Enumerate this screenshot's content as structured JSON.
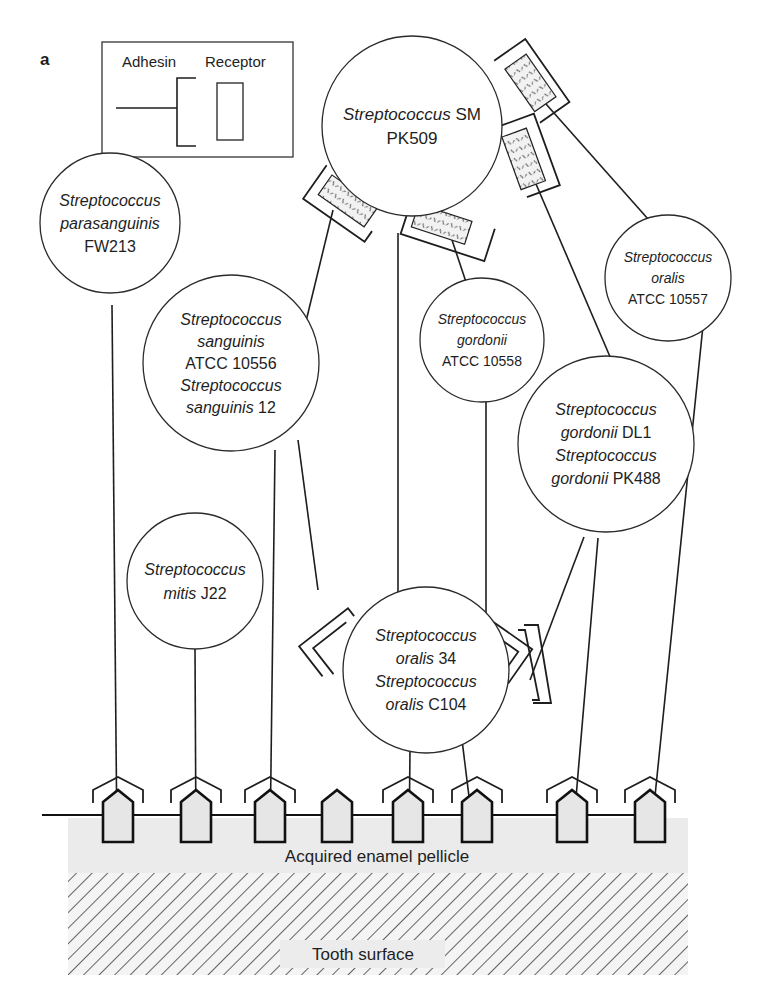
{
  "panel_label": "a",
  "legend": {
    "adhesin_label": "Adhesin",
    "receptor_label": "Receptor"
  },
  "cells": [
    {
      "id": "sm-pk509",
      "lines": [
        {
          "italic": "Streptococcus",
          "plain": " SM"
        },
        {
          "italic": "",
          "plain": "PK509"
        }
      ]
    },
    {
      "id": "parasanguinis-fw213",
      "lines": [
        {
          "italic": "Streptococcus",
          "plain": ""
        },
        {
          "italic": "parasanguinis",
          "plain": ""
        },
        {
          "italic": "",
          "plain": "FW213"
        }
      ]
    },
    {
      "id": "sanguinis",
      "lines": [
        {
          "italic": "Streptococcus",
          "plain": ""
        },
        {
          "italic": "sanguinis",
          "plain": ""
        },
        {
          "italic": "",
          "plain": "ATCC 10556"
        },
        {
          "italic": "Streptococcus",
          "plain": ""
        },
        {
          "italic": "sanguinis",
          "plain": " 12"
        }
      ]
    },
    {
      "id": "gordonii-10558",
      "lines": [
        {
          "italic": "Streptococcus",
          "plain": ""
        },
        {
          "italic": "gordonii",
          "plain": ""
        },
        {
          "italic": "",
          "plain": "ATCC 10558"
        }
      ]
    },
    {
      "id": "oralis-10557",
      "lines": [
        {
          "italic": "Streptococcus",
          "plain": ""
        },
        {
          "italic": "oralis",
          "plain": ""
        },
        {
          "italic": "",
          "plain": "ATCC 10557"
        }
      ]
    },
    {
      "id": "gordonii-dl1-pk488",
      "lines": [
        {
          "italic": "Streptococcus",
          "plain": ""
        },
        {
          "italic": "gordonii",
          "plain": " DL1"
        },
        {
          "italic": "Streptococcus",
          "plain": ""
        },
        {
          "italic": "gordonii",
          "plain": " PK488"
        }
      ]
    },
    {
      "id": "mitis-j22",
      "lines": [
        {
          "italic": "Streptococcus",
          "plain": ""
        },
        {
          "italic": "mitis",
          "plain": " J22"
        }
      ]
    },
    {
      "id": "oralis-34-c104",
      "lines": [
        {
          "italic": "Streptococcus",
          "plain": ""
        },
        {
          "italic": "oralis",
          "plain": " 34"
        },
        {
          "italic": "Streptococcus",
          "plain": ""
        },
        {
          "italic": "oralis",
          "plain": " C104"
        }
      ]
    }
  ],
  "layers": {
    "pellicle_label": "Acquired enamel pellicle",
    "tooth_label": "Tooth surface"
  },
  "colors": {
    "ink": "#1e1e1e",
    "pellicle": "#ebebeb",
    "receptor_fill": "#e6e6e6"
  }
}
